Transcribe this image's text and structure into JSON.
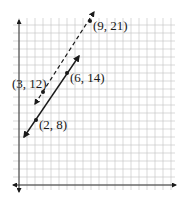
{
  "chart_data": {
    "type": "line",
    "title": "",
    "xlabel": "",
    "ylabel": "",
    "grid": true,
    "legend": null,
    "series": [
      {
        "name": "solid-line",
        "style": "solid",
        "points": [
          {
            "x": 2,
            "y": 8,
            "label": "(2, 8)"
          },
          {
            "x": 6,
            "y": 14,
            "label": "(6, 14)"
          }
        ]
      },
      {
        "name": "dashed-line",
        "style": "dashed",
        "points": [
          {
            "x": 3,
            "y": 12,
            "label": "(3, 12)"
          },
          {
            "x": 9,
            "y": 21,
            "label": "(9, 21)"
          }
        ]
      }
    ],
    "annotations": [
      "(9, 21)",
      "(3, 12)",
      "(6, 14)",
      "(2, 8)"
    ]
  },
  "labels": {
    "p1": "(9, 21)",
    "p2": "(3, 12)",
    "p3": "(6, 14)",
    "p4": "(2, 8)"
  },
  "colors": {
    "grid": "#c8c8c8",
    "axis": "#333333",
    "line": "#1a1a1a"
  }
}
